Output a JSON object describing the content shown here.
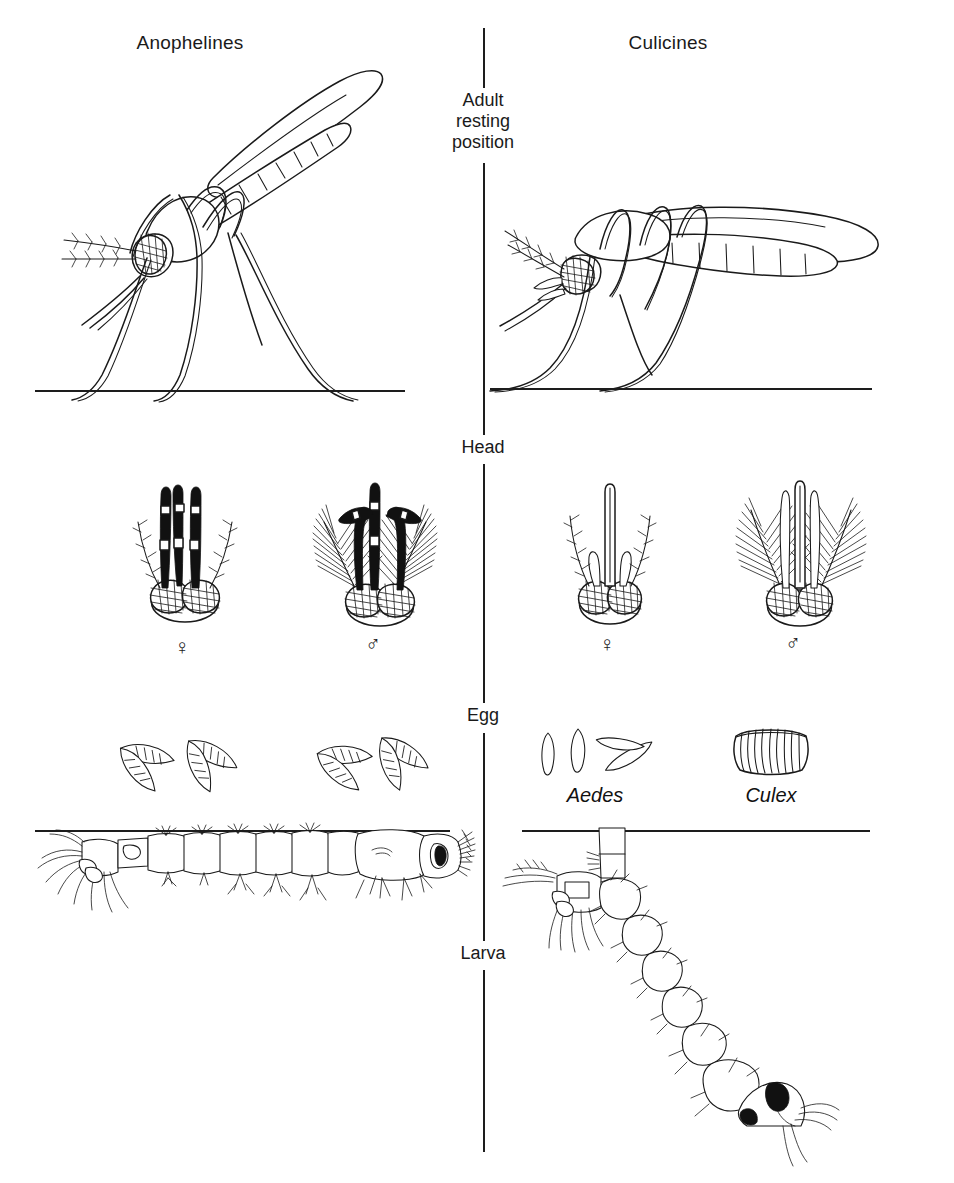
{
  "figure": {
    "background_color": "#ffffff",
    "ink_color": "#1a1a1a"
  },
  "columns": {
    "left": {
      "heading": "Anophelines"
    },
    "right": {
      "heading": "Culicines"
    }
  },
  "stages": [
    {
      "key": "adult",
      "label_lines": [
        "Adult",
        "resting",
        "position"
      ],
      "label": "Adult resting position"
    },
    {
      "key": "head",
      "label_lines": [
        "Head"
      ],
      "label": "Head"
    },
    {
      "key": "egg",
      "label_lines": [
        "Egg"
      ],
      "label": "Egg"
    },
    {
      "key": "larva",
      "label_lines": [
        "Larva"
      ],
      "label": "Larva"
    }
  ],
  "adult_row": {
    "left": {
      "resting_posture": "body held at a steep angle, about 45 degrees to the surface",
      "ground_line": true
    },
    "right": {
      "resting_posture": "body held roughly parallel to the surface, hunched",
      "ground_line": true
    }
  },
  "head_row": {
    "left": [
      {
        "sex_symbol": "♀",
        "sex": "female",
        "antennae": "sparse hairs",
        "palps": "long, dark, with pale bands, same length as proboscis"
      },
      {
        "sex_symbol": "♂",
        "sex": "male",
        "antennae": "plumose",
        "palps": "long, club shaped tips"
      }
    ],
    "right": [
      {
        "sex_symbol": "♀",
        "sex": "female",
        "antennae": "sparse hairs",
        "palps": "short, much shorter than proboscis"
      },
      {
        "sex_symbol": "♂",
        "sex": "male",
        "antennae": "plumose",
        "palps": "long, tapering and upcurved"
      }
    ]
  },
  "egg_row": {
    "left": {
      "description": "boat shaped eggs with lateral floats, laid singly",
      "egg_count": 4
    },
    "right": [
      {
        "taxon": "Aedes",
        "description": "oval eggs without floats, laid singly",
        "egg_count": 4
      },
      {
        "taxon": "Culex",
        "description": "eggs stuck together in an upright raft",
        "egg_count": 12
      }
    ]
  },
  "larva_row": {
    "left": {
      "posture": "lies horizontally, parallel to the water surface",
      "siphon": "absent",
      "water_line": true
    },
    "right": {
      "posture": "hangs head down at an angle to the water surface",
      "siphon": "present, long breathing siphon",
      "water_line": true
    }
  }
}
